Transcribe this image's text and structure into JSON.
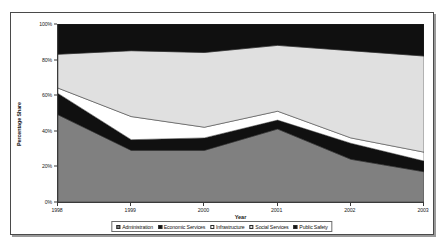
{
  "chart_data": {
    "type": "area",
    "stacked": true,
    "stack_mode": "percent",
    "title": "",
    "subtitle": "",
    "xlabel": "Year",
    "ylabel": "Percentage Share",
    "x": [
      "1998",
      "1999",
      "2000",
      "2001",
      "2002",
      "2003"
    ],
    "categories": [
      "1998",
      "1999",
      "2000",
      "2001",
      "2002",
      "2003"
    ],
    "xtick_labels": [
      "1998",
      "1999",
      "2000",
      "2001",
      "2002",
      "2003"
    ],
    "ytick_labels": [
      "0%",
      "20%",
      "40%",
      "60%",
      "80%",
      "100%"
    ],
    "ytick_values": [
      0,
      20,
      40,
      60,
      80,
      100
    ],
    "ylim": [
      0,
      100
    ],
    "grid": false,
    "legend_position": "bottom",
    "series": [
      {
        "name": "Administration",
        "color": "#808080",
        "values": [
          49,
          29,
          29,
          41,
          24,
          17
        ]
      },
      {
        "name": "Economic Services",
        "color": "#101010",
        "values": [
          12,
          6,
          7,
          5,
          9,
          6
        ]
      },
      {
        "name": "Infrastructure",
        "color": "#ffffff",
        "values": [
          3,
          13,
          6,
          5,
          3,
          5
        ]
      },
      {
        "name": "Social Services",
        "color": "#e0e0e0",
        "values": [
          19,
          37,
          42,
          37,
          49,
          54
        ]
      },
      {
        "name": "Public Safety",
        "color": "#101010",
        "values": [
          17,
          15,
          16,
          12,
          15,
          18
        ]
      }
    ],
    "cumulative_tops": [
      [
        49,
        61,
        64,
        83,
        100
      ],
      [
        29,
        35,
        48,
        85,
        100
      ],
      [
        29,
        36,
        42,
        84,
        100
      ],
      [
        41,
        46,
        51,
        88,
        100
      ],
      [
        24,
        33,
        36,
        85,
        100
      ],
      [
        17,
        23,
        28,
        82,
        100
      ]
    ]
  },
  "legend": {
    "items": [
      {
        "label": "Administration",
        "color": "#808080"
      },
      {
        "label": "Economic Services",
        "color": "#101010"
      },
      {
        "label": "Infrastructure",
        "color": "#ffffff"
      },
      {
        "label": "Social Services",
        "color": "#e0e0e0"
      },
      {
        "label": "Public Safety",
        "color": "#101010"
      }
    ]
  }
}
